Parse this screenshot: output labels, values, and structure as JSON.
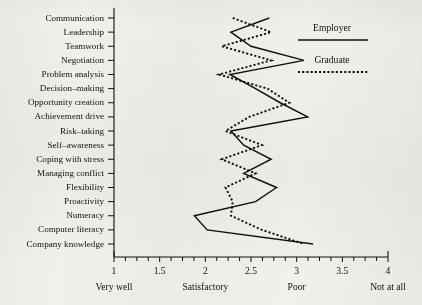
{
  "chart_data": {
    "type": "line",
    "title": "",
    "subtitle": "",
    "orientation": "horizontal",
    "xlabel": "",
    "ylabel": "",
    "xlim": [
      1,
      4
    ],
    "grid": false,
    "legend_position": "top-right",
    "categories": [
      "Communication",
      "Leadership",
      "Teamwork",
      "Negotiation",
      "Problem analysis",
      "Decision–making",
      "Opportunity creation",
      "Achievement drive",
      "Risk–taking",
      "Self–awareness",
      "Coping with stress",
      "Managing conflict",
      "Flexibility",
      "Proactivity",
      "Numeracy",
      "Computer literacy",
      "Company knowledge"
    ],
    "xticks": [
      1,
      1.5,
      2,
      2.5,
      3,
      3.5,
      4
    ],
    "xtick_labels": [
      "1",
      "1.5",
      "2",
      "2.5",
      "3",
      "3.5",
      "4"
    ],
    "x_category_labels": [
      {
        "value": 1,
        "label": "Very well"
      },
      {
        "value": 2,
        "label": "Satisfactory"
      },
      {
        "value": 3,
        "label": "Poor"
      },
      {
        "value": 4,
        "label": "Not at all"
      }
    ],
    "series": [
      {
        "name": "Employer",
        "style": "solid",
        "color": "#12100e",
        "values": [
          2.7,
          2.28,
          2.5,
          3.08,
          2.27,
          2.55,
          2.82,
          3.12,
          2.28,
          2.42,
          2.72,
          2.42,
          2.78,
          2.55,
          1.88,
          2.02,
          3.18
        ]
      },
      {
        "name": "Graduate",
        "style": "dashed",
        "color": "#12100e",
        "values": [
          2.3,
          2.72,
          2.18,
          2.72,
          2.15,
          2.68,
          2.92,
          2.48,
          2.22,
          2.62,
          2.18,
          2.55,
          2.22,
          2.3,
          2.28,
          2.62,
          3.08
        ]
      }
    ]
  },
  "legend": {
    "entries": [
      {
        "label": "Employer",
        "style": "solid"
      },
      {
        "label": "Graduate",
        "style": "dashed"
      }
    ]
  }
}
